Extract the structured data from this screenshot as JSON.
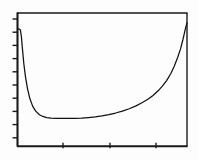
{
  "figure": {
    "title": "",
    "background_color": "#fdfdfd",
    "ink_color": "#111111",
    "frame_color": "#1a1a1a"
  },
  "chart_data": {
    "type": "line",
    "title": "",
    "subtitle": "",
    "xlabel": "",
    "ylabel": "",
    "legend": [],
    "legend_position": "none",
    "grid": false,
    "axis_frame": "box",
    "xlim": [
      0,
      1
    ],
    "ylim": [
      0,
      1
    ],
    "x_ticks": [
      0.27,
      0.55,
      0.81
    ],
    "x_tick_labels": [
      "",
      "",
      ""
    ],
    "y_ticks": [
      0.04,
      0.14,
      0.24,
      0.34,
      0.44,
      0.54,
      0.64,
      0.74,
      0.84,
      0.94
    ],
    "y_tick_labels": [
      "",
      "",
      "",
      "",
      "",
      "",
      "",
      "",
      "",
      ""
    ],
    "series": [
      {
        "name": "curve",
        "x": [
          0.005,
          0.01,
          0.015,
          0.02,
          0.026,
          0.032,
          0.04,
          0.05,
          0.062,
          0.076,
          0.092,
          0.11,
          0.132,
          0.152,
          0.175,
          0.2,
          0.23,
          0.265,
          0.3,
          0.34,
          0.38,
          0.42,
          0.46,
          0.5,
          0.54,
          0.58,
          0.62,
          0.66,
          0.7,
          0.735,
          0.77,
          0.8,
          0.83,
          0.855,
          0.88,
          0.905,
          0.925,
          0.945,
          0.962,
          0.975,
          0.985,
          0.993,
          1.0
        ],
        "y": [
          0.88,
          0.88,
          0.878,
          0.872,
          0.82,
          0.73,
          0.62,
          0.52,
          0.43,
          0.355,
          0.3,
          0.262,
          0.235,
          0.222,
          0.214,
          0.21,
          0.208,
          0.207,
          0.207,
          0.208,
          0.21,
          0.214,
          0.219,
          0.226,
          0.236,
          0.248,
          0.262,
          0.28,
          0.302,
          0.325,
          0.352,
          0.38,
          0.415,
          0.45,
          0.492,
          0.545,
          0.6,
          0.665,
          0.73,
          0.795,
          0.85,
          0.895,
          0.925
        ]
      }
    ]
  },
  "plot_geometry": {
    "frame_left_px": 17,
    "frame_right_px": 187,
    "frame_top_px": 13,
    "frame_bottom_px": 146,
    "y_tick_count": 10,
    "x_tick_count": 3,
    "tick_length_px": 5
  }
}
